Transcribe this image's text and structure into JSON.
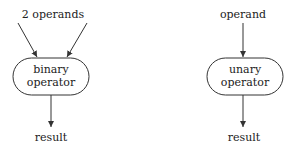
{
  "diagram": {
    "binary": {
      "input_label": "2 operands",
      "node_line1": "binary",
      "node_line2": "operator",
      "output_label": "result"
    },
    "unary": {
      "input_label": "operand",
      "node_line1": "unary",
      "node_line2": "operator",
      "output_label": "result"
    },
    "colors": {
      "stroke": "#333333",
      "text": "#222222",
      "background": "#ffffff"
    }
  }
}
